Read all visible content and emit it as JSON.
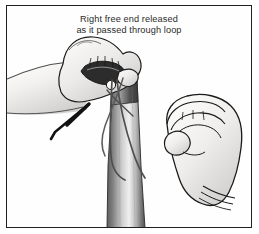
{
  "figure": {
    "title_line_1": "Right free end released",
    "title_line_2": "as it passed through loop",
    "frame_border_color": "#231f20",
    "background_color": "#fefefe",
    "caption_color": "#2b2b2b",
    "illustration_type": "line-drawing",
    "elements": {
      "left_hand_label": "left-hand-gripping-suture",
      "right_hand_label": "right-hand-released",
      "band_label": "vertical-tissue-band",
      "suture_label": "suture-strands",
      "knot_label": "knot-bead"
    },
    "shading": {
      "skin_light": "#f4f3f1",
      "skin_mid": "#dedcda",
      "skin_shadow": "#b9b7b5",
      "outline": "#1a1a1a",
      "band_dark": "#4a4a4a",
      "band_mid": "#9b9b9b",
      "band_light": "#ededed",
      "suture_color": "#5c5c5c",
      "thread_dark": "#111111"
    }
  }
}
